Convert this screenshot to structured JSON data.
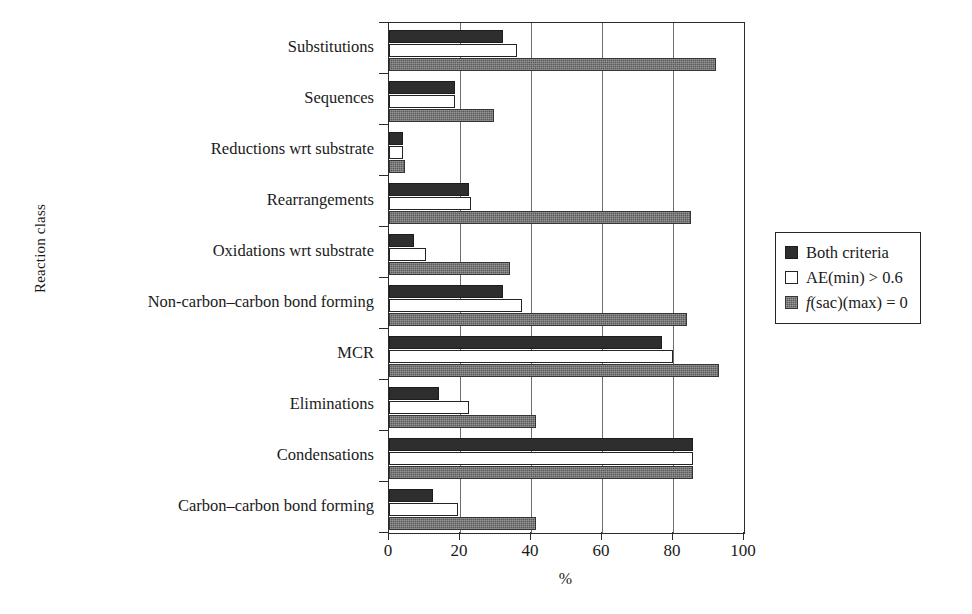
{
  "chart_data": {
    "type": "bar",
    "orientation": "horizontal",
    "title": "",
    "xlabel": "%",
    "ylabel": "Reaction class",
    "xlim": [
      0,
      100
    ],
    "xticks": [
      0,
      20,
      40,
      60,
      80,
      100
    ],
    "grid": "vertical",
    "legend_position": "right",
    "categories": [
      "Substitutions",
      "Sequences",
      "Reductions wrt substrate",
      "Rearrangements",
      "Oxidations wrt substrate",
      "Non-carbon–carbon bond forming",
      "MCR",
      "Eliminations",
      "Condensations",
      "Carbon–carbon bond forming"
    ],
    "series": [
      {
        "name": "Both criteria",
        "key": "both",
        "color": "#2e2e2e",
        "values": [
          32,
          18.5,
          4,
          22.5,
          7,
          32,
          77,
          14,
          85.5,
          12.5
        ]
      },
      {
        "name": "AE(min) > 0.6",
        "key": "ae",
        "color": "#ffffff",
        "values": [
          36,
          18.5,
          4,
          23,
          10.5,
          37.5,
          80,
          22.5,
          85.5,
          19.5
        ]
      },
      {
        "name": "f(sac)(max) = 0",
        "key": "fsac",
        "color": "#5b5b5b",
        "values": [
          92,
          29.5,
          4.5,
          85,
          34,
          84,
          93,
          41.5,
          85.5,
          41.5
        ]
      }
    ]
  },
  "legend": {
    "items": [
      {
        "label": "Both criteria",
        "swatch": "both"
      },
      {
        "label": "AE(min) > 0.6",
        "swatch": "ae"
      },
      {
        "label": "f(sac)(max) = 0",
        "swatch": "fsac",
        "italic_prefix": "f",
        "rest": "(sac)(max) = 0"
      }
    ]
  },
  "axes": {
    "x_label": "%",
    "y_label": "Reaction class",
    "x_tick_labels": [
      "0",
      "20",
      "40",
      "60",
      "80",
      "100"
    ]
  }
}
